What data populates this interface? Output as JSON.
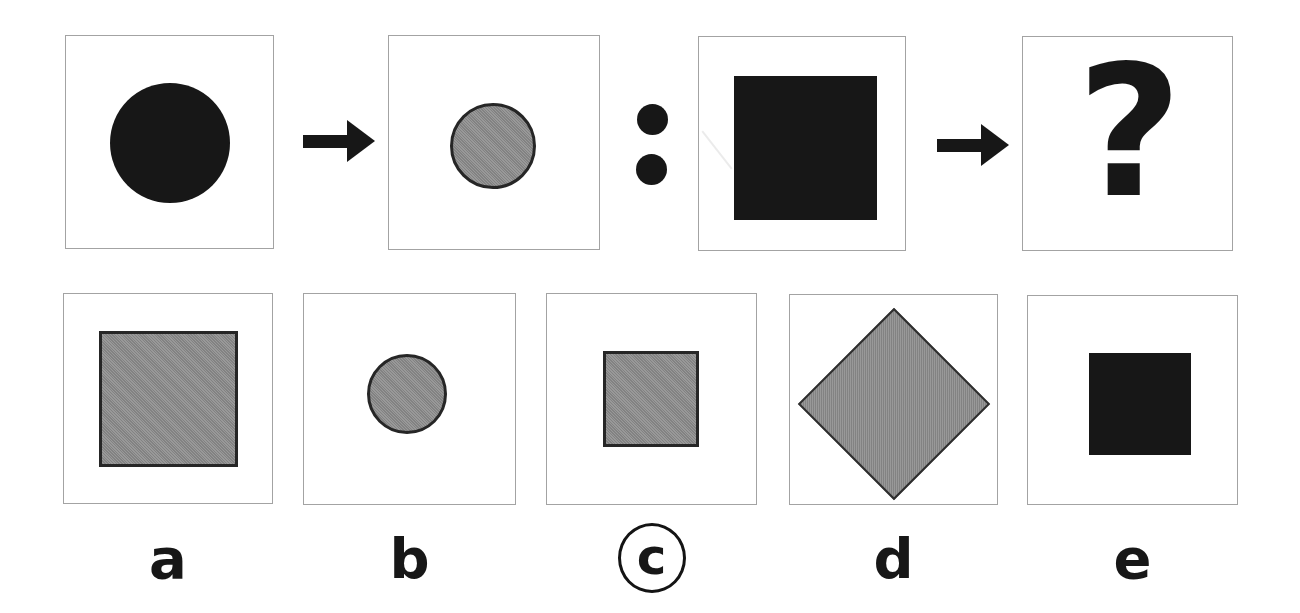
{
  "puzzle_type": "visual-analogy-question",
  "analogy": {
    "left_pair": {
      "premise_shape": "large-black-circle",
      "result_shape": "small-gray-circle"
    },
    "right_pair": {
      "premise_shape": "large-black-square",
      "result_shape": "unknown"
    },
    "question_mark": "?",
    "separator_icon": "colon-dots",
    "transform_icon": "arrow-right"
  },
  "options": [
    {
      "label": "a",
      "shape": "large-gray-square",
      "selected": false
    },
    {
      "label": "b",
      "shape": "small-gray-circle",
      "selected": false
    },
    {
      "label": "c",
      "shape": "small-gray-square",
      "selected": true
    },
    {
      "label": "d",
      "shape": "large-gray-diamond",
      "selected": false
    },
    {
      "label": "e",
      "shape": "small-black-square",
      "selected": false
    }
  ],
  "marked_answer": "c",
  "colors": {
    "background": "#ffffff",
    "frame_border": "#a3a3a3",
    "black_shape": "#171717",
    "gray_shape": "#919191",
    "gray_shape_border": "#262626"
  }
}
